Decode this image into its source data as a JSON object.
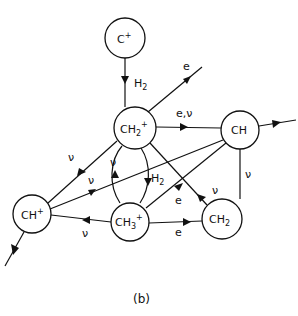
{
  "diagram": {
    "caption": "(b)",
    "nodes": [
      {
        "id": "C+",
        "label": "C",
        "sup": "+",
        "sub": ""
      },
      {
        "id": "CH2+",
        "label": "CH",
        "sub": "2",
        "sup": "+"
      },
      {
        "id": "CH",
        "label": "CH",
        "sub": "",
        "sup": ""
      },
      {
        "id": "CH+",
        "label": "CH",
        "sub": "",
        "sup": "+"
      },
      {
        "id": "CH3+",
        "label": "CH",
        "sub": "3",
        "sup": "+"
      },
      {
        "id": "CH2",
        "label": "CH",
        "sub": "2",
        "sup": ""
      }
    ],
    "edges": [
      {
        "from": "C+",
        "to": "CH2+",
        "label": "H2"
      },
      {
        "from": "CH2+",
        "to": "out-upper-right",
        "label": "e"
      },
      {
        "from": "CH2+",
        "to": "CH",
        "label": "e,ν"
      },
      {
        "from": "CH",
        "to": "out-right",
        "label": ""
      },
      {
        "from": "CH2+",
        "to": "CH+",
        "label": "ν"
      },
      {
        "from": "CH",
        "to": "CH+",
        "label": "ν"
      },
      {
        "from": "CH3+",
        "to": "CH2+",
        "label": "ν"
      },
      {
        "from": "CH2+",
        "to": "CH3+",
        "label": "H2"
      },
      {
        "from": "CH",
        "to": "CH3+ region",
        "label": ""
      },
      {
        "from": "CH3+",
        "to": "CH",
        "label": "e"
      },
      {
        "from": "CH2",
        "to": "CH2+",
        "label": "ν"
      },
      {
        "from": "CH",
        "to": "CH2",
        "label": "ν"
      },
      {
        "from": "CH3+",
        "to": "CH+",
        "label": "ν"
      },
      {
        "from": "CH3+",
        "to": "CH2",
        "label": "e"
      },
      {
        "from": "CH+",
        "to": "out-lower-left",
        "label": ""
      }
    ],
    "labels": {
      "c_plus": "C",
      "c_plus_sup": "+",
      "ch2p": "CH",
      "ch2p_sub": "2",
      "ch2p_sup": "+",
      "ch": "CH",
      "chp": "CH",
      "chp_sup": "+",
      "ch3p": "CH",
      "ch3p_sub": "3",
      "ch3p_sup": "+",
      "ch2": "CH",
      "ch2_sub": "2",
      "h2": "H",
      "h2_sub": "2",
      "e": "e",
      "e_nu": "e,ν",
      "nu": "ν"
    }
  }
}
